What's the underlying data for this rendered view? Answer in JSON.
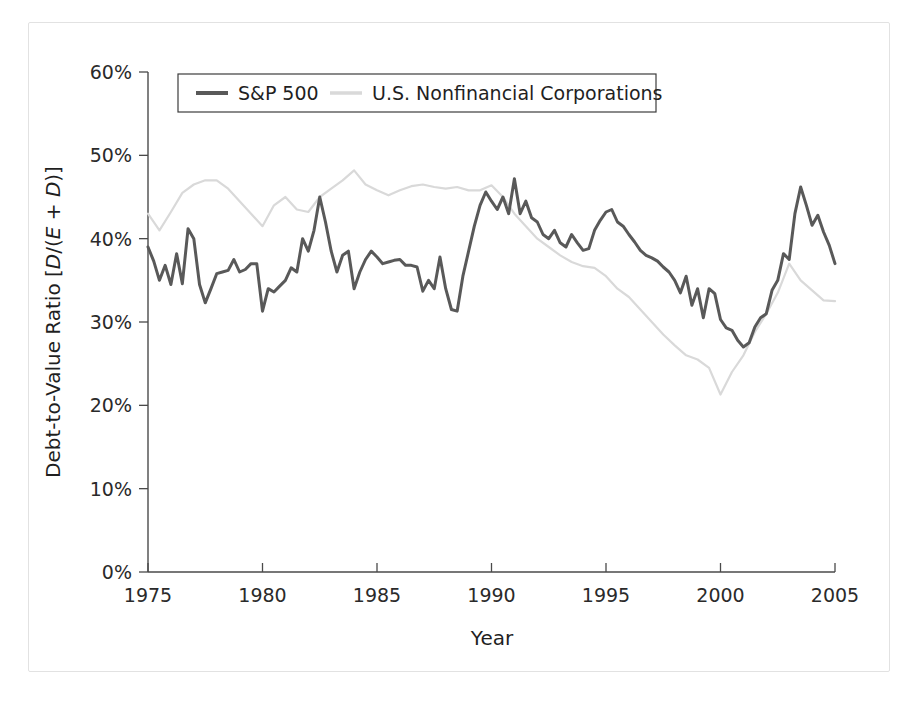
{
  "figure": {
    "background_color": "#ffffff",
    "frame_color": "#e2e2e2"
  },
  "chart_data": {
    "type": "line",
    "title": "",
    "subtitle": "",
    "xlabel": "Year",
    "ylabel": "Debt-to-Value Ratio [D/(E + D)]",
    "ylabel_parts": {
      "prefix": "Debt-to-Value Ratio [",
      "numerator": "D",
      "middle": "/(",
      "denominator_e": "E",
      "plus": " + ",
      "denominator_d": "D",
      "suffix": ")]"
    },
    "xlim": [
      1975,
      2005
    ],
    "ylim": [
      0,
      60
    ],
    "grid": false,
    "x_ticks": [
      1975,
      1980,
      1985,
      1990,
      1995,
      2000,
      2005
    ],
    "x_tick_labels": [
      "1975",
      "1980",
      "1985",
      "1990",
      "1995",
      "2000",
      "2005"
    ],
    "y_ticks": [
      0,
      10,
      20,
      30,
      40,
      50,
      60
    ],
    "y_tick_labels": [
      "0%",
      "10%",
      "20%",
      "30%",
      "40%",
      "50%",
      "60%"
    ],
    "legend_position": "top-left-inside",
    "series": [
      {
        "name": "S&P 500",
        "color": "#595959",
        "line_style": "solid",
        "line_width": 3.0,
        "x": [
          1975.0,
          1975.25,
          1975.5,
          1975.75,
          1976.0,
          1976.25,
          1976.5,
          1976.75,
          1977.0,
          1977.25,
          1977.5,
          1977.75,
          1978.0,
          1978.25,
          1978.5,
          1978.75,
          1979.0,
          1979.25,
          1979.5,
          1979.75,
          1980.0,
          1980.25,
          1980.5,
          1980.75,
          1981.0,
          1981.25,
          1981.5,
          1981.75,
          1982.0,
          1982.25,
          1982.5,
          1982.75,
          1983.0,
          1983.25,
          1983.5,
          1983.75,
          1984.0,
          1984.25,
          1984.5,
          1984.75,
          1985.0,
          1985.25,
          1985.5,
          1985.75,
          1986.0,
          1986.25,
          1986.5,
          1986.75,
          1987.0,
          1987.25,
          1987.5,
          1987.75,
          1988.0,
          1988.25,
          1988.5,
          1988.75,
          1989.0,
          1989.25,
          1989.5,
          1989.75,
          1990.0,
          1990.25,
          1990.5,
          1990.75,
          1991.0,
          1991.25,
          1991.5,
          1991.75,
          1992.0,
          1992.25,
          1992.5,
          1992.75,
          1993.0,
          1993.25,
          1993.5,
          1993.75,
          1994.0,
          1994.25,
          1994.5,
          1994.75,
          1995.0,
          1995.25,
          1995.5,
          1995.75,
          1996.0,
          1996.25,
          1996.5,
          1996.75,
          1997.0,
          1997.25,
          1997.5,
          1997.75,
          1998.0,
          1998.25,
          1998.5,
          1998.75,
          1999.0,
          1999.25,
          1999.5,
          1999.75,
          2000.0,
          2000.25,
          2000.5,
          2000.75,
          2001.0,
          2001.25,
          2001.5,
          2001.75,
          2002.0,
          2002.25,
          2002.5,
          2002.75,
          2003.0,
          2003.25,
          2003.5,
          2003.75,
          2004.0,
          2004.25,
          2004.5,
          2004.75,
          2005.0
        ],
        "y": [
          39.0,
          37.3,
          35.0,
          36.8,
          34.5,
          38.2,
          34.6,
          41.2,
          40.0,
          34.5,
          32.3,
          34.0,
          35.8,
          36.0,
          36.2,
          37.5,
          36.0,
          36.3,
          37.0,
          37.0,
          31.3,
          34.0,
          33.6,
          34.3,
          35.0,
          36.5,
          36.0,
          40.0,
          38.5,
          41.0,
          45.0,
          42.0,
          38.5,
          36.0,
          38.0,
          38.5,
          34.0,
          36.0,
          37.5,
          38.5,
          37.8,
          37.0,
          37.2,
          37.4,
          37.5,
          36.8,
          36.8,
          36.6,
          33.7,
          35.0,
          34.0,
          37.8,
          34.0,
          31.5,
          31.3,
          35.5,
          38.5,
          41.5,
          44.0,
          45.6,
          44.5,
          43.5,
          45.0,
          43.0,
          47.2,
          43.0,
          44.5,
          42.5,
          42.0,
          40.5,
          40.0,
          41.0,
          39.5,
          39.0,
          40.5,
          39.5,
          38.6,
          38.8,
          41.0,
          42.2,
          43.2,
          43.5,
          42.0,
          41.5,
          40.5,
          39.6,
          38.6,
          38.0,
          37.7,
          37.3,
          36.6,
          36.0,
          35.0,
          33.5,
          35.5,
          32.0,
          34.0,
          30.5,
          34.0,
          33.4,
          30.3,
          29.3,
          29.0,
          27.8,
          27.0,
          27.5,
          29.4,
          30.5,
          31.0,
          33.8,
          35.0,
          38.2,
          37.5,
          43.0,
          46.2,
          44.0,
          41.6,
          42.8,
          40.8,
          39.2,
          37.0
        ],
        "y_unit": "percent"
      },
      {
        "name": "U.S. Nonfinancial Corporations",
        "color": "#d9d9d9",
        "line_style": "solid",
        "line_width": 2.2,
        "x": [
          1975.0,
          1975.5,
          1976.0,
          1976.5,
          1977.0,
          1977.5,
          1978.0,
          1978.5,
          1979.0,
          1979.5,
          1980.0,
          1980.5,
          1981.0,
          1981.5,
          1982.0,
          1982.5,
          1983.0,
          1983.5,
          1984.0,
          1984.5,
          1985.0,
          1985.5,
          1986.0,
          1986.5,
          1987.0,
          1987.5,
          1988.0,
          1988.5,
          1989.0,
          1989.5,
          1990.0,
          1990.5,
          1991.0,
          1991.5,
          1992.0,
          1992.5,
          1993.0,
          1993.5,
          1994.0,
          1994.5,
          1995.0,
          1995.5,
          1996.0,
          1996.5,
          1997.0,
          1997.5,
          1998.0,
          1998.5,
          1999.0,
          1999.5,
          2000.0,
          2000.5,
          2001.0,
          2001.5,
          2002.0,
          2002.5,
          2003.0,
          2003.5,
          2004.0,
          2004.5,
          2005.0
        ],
        "y": [
          43.0,
          41.0,
          43.2,
          45.5,
          46.5,
          47.0,
          47.0,
          46.0,
          44.5,
          43.0,
          41.5,
          44.0,
          45.0,
          43.5,
          43.2,
          45.0,
          46.0,
          47.0,
          48.2,
          46.5,
          45.8,
          45.2,
          45.8,
          46.3,
          46.5,
          46.2,
          46.0,
          46.2,
          45.8,
          45.8,
          46.4,
          45.0,
          43.0,
          41.5,
          40.0,
          39.0,
          38.0,
          37.2,
          36.7,
          36.5,
          35.5,
          34.0,
          33.0,
          31.5,
          30.0,
          28.5,
          27.2,
          26.0,
          25.5,
          24.5,
          21.3,
          24.0,
          26.0,
          28.8,
          31.0,
          33.5,
          37.0,
          35.0,
          33.8,
          32.6,
          32.5
        ],
        "y_unit": "percent"
      }
    ]
  },
  "legend": {
    "items": [
      {
        "label": "S&P 500",
        "swatch": "line-swatch-dark",
        "color": "#595959"
      },
      {
        "label": "U.S. Nonfinancial Corporations",
        "swatch": "line-swatch-light",
        "color": "#d9d9d9"
      }
    ]
  }
}
